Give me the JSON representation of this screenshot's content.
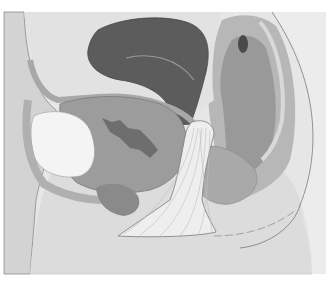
{
  "figure": {
    "style": "grayscale anatomical illustration",
    "colors": {
      "background": "#ffffff",
      "frame": "#e6e6e6",
      "skin_outer": "#cfcfcf",
      "tissue_light": "#dadada",
      "tissue_mid": "#b4b4b4",
      "tissue_dark": "#8e8e8e",
      "uterus": "#5a5a5a",
      "bladder_light": "#f2f2f2",
      "sling": "#eeeeee",
      "outline": "#6f6f6f"
    },
    "structures": [
      {
        "name": "abdominal-wall"
      },
      {
        "name": "bladder"
      },
      {
        "name": "uterus"
      },
      {
        "name": "rectum"
      },
      {
        "name": "sacrum-soft-tissue"
      },
      {
        "name": "sling-mesh"
      },
      {
        "name": "pubic-region"
      }
    ]
  },
  "caption": {
    "text": "",
    "clipped": true
  }
}
